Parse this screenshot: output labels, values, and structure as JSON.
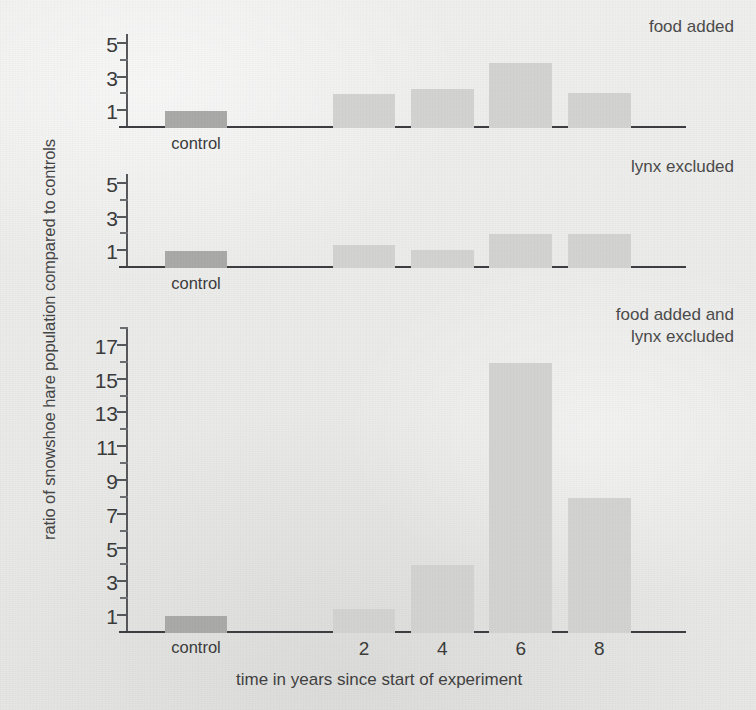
{
  "chart_data": {
    "type": "bar",
    "title": "",
    "xlabel": "time in years since start of experiment",
    "ylabel": "ratio of snowshoe hare population compared to controls",
    "categories": [
      "control",
      "2",
      "4",
      "6",
      "8"
    ],
    "grid": false,
    "legend_position": "none",
    "panels": [
      {
        "label": "food added",
        "ylim": [
          0,
          5.6
        ],
        "yticks": [
          1,
          3,
          5
        ],
        "ytick_labels": [
          "1",
          "3",
          "5"
        ],
        "yminor_ticks": [
          2,
          4
        ],
        "values": [
          1,
          2,
          2.3,
          3.9,
          2.1
        ],
        "bar_kinds": [
          "control",
          "normal",
          "normal",
          "normal",
          "normal"
        ]
      },
      {
        "label": "lynx excluded",
        "ylim": [
          0,
          5.6
        ],
        "yticks": [
          1,
          3,
          5
        ],
        "ytick_labels": [
          "1",
          "3",
          "5"
        ],
        "yminor_ticks": [
          2,
          4
        ],
        "values": [
          1,
          1.4,
          1.05,
          2,
          2
        ],
        "bar_kinds": [
          "control",
          "normal",
          "normal",
          "normal",
          "normal"
        ]
      },
      {
        "label": "food added and\nlynx excluded",
        "ylim": [
          0,
          18
        ],
        "yticks": [
          1,
          3,
          5,
          7,
          9,
          11,
          13,
          15,
          17
        ],
        "ytick_labels": [
          "1",
          "3",
          "5",
          "7",
          "9",
          "11",
          "13",
          "15",
          "17"
        ],
        "yminor_ticks": [
          2,
          4,
          6,
          8,
          10,
          12,
          14,
          16,
          18
        ],
        "values": [
          1,
          1.4,
          4,
          16,
          8
        ],
        "bar_kinds": [
          "control",
          "normal",
          "normal",
          "normal",
          "normal"
        ]
      }
    ],
    "colors": {
      "background": "#ebebea",
      "bar_normal": "#d2d2d1",
      "bar_control": "#a9a9a8",
      "axis": "#55565a",
      "text": "#3b3b3b"
    }
  },
  "axis": {
    "y_title": "ratio of snowshoe hare population compared to controls",
    "x_title": "time in years since start of experiment"
  },
  "panel1": {
    "title": "food added",
    "ytick_0": "1",
    "ytick_1": "3",
    "ytick_2": "5",
    "xtick_control": "control"
  },
  "panel2": {
    "title": "lynx excluded",
    "ytick_0": "1",
    "ytick_1": "3",
    "ytick_2": "5",
    "xtick_control": "control"
  },
  "panel3": {
    "title": "food added and\nlynx excluded",
    "ytick_0": "1",
    "ytick_1": "3",
    "ytick_2": "5",
    "ytick_3": "7",
    "ytick_4": "9",
    "ytick_5": "11",
    "ytick_6": "13",
    "ytick_7": "15",
    "ytick_8": "17",
    "xtick_control": "control",
    "xtick_2": "2",
    "xtick_4": "4",
    "xtick_6": "6",
    "xtick_8": "8"
  }
}
